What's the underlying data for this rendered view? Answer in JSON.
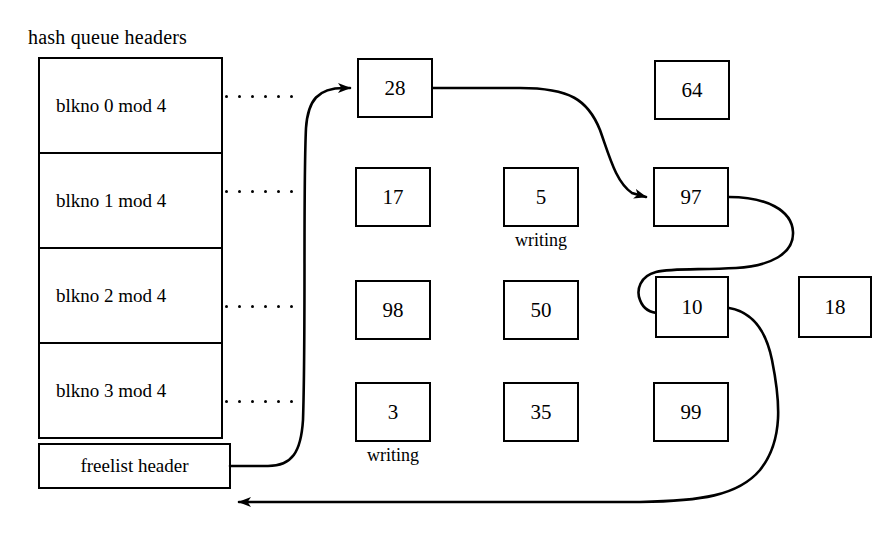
{
  "diagram": {
    "title": "hash queue headers",
    "freelist_label": "freelist header",
    "hash_rows": [
      {
        "label": "blkno 0 mod 4"
      },
      {
        "label": "blkno 1 mod 4"
      },
      {
        "label": "blkno 2 mod 4"
      },
      {
        "label": "blkno 3 mod 4"
      }
    ],
    "buffers": [
      {
        "id": "buf-28",
        "value": "28",
        "note": "",
        "x": 357,
        "y": 58,
        "w": 76,
        "h": 60
      },
      {
        "id": "buf-64",
        "value": "64",
        "note": "",
        "x": 654,
        "y": 60,
        "w": 76,
        "h": 60
      },
      {
        "id": "buf-17",
        "value": "17",
        "note": "",
        "x": 355,
        "y": 167,
        "w": 76,
        "h": 60
      },
      {
        "id": "buf-5",
        "value": "5",
        "note": "writing",
        "x": 503,
        "y": 167,
        "w": 76,
        "h": 60
      },
      {
        "id": "buf-97",
        "value": "97",
        "note": "",
        "x": 653,
        "y": 167,
        "w": 76,
        "h": 60
      },
      {
        "id": "buf-98",
        "value": "98",
        "note": "",
        "x": 355,
        "y": 280,
        "w": 76,
        "h": 60
      },
      {
        "id": "buf-50",
        "value": "50",
        "note": "",
        "x": 503,
        "y": 280,
        "w": 76,
        "h": 60
      },
      {
        "id": "buf-10",
        "value": "10",
        "note": "",
        "x": 655,
        "y": 276,
        "w": 74,
        "h": 62
      },
      {
        "id": "buf-18",
        "value": "18",
        "note": "",
        "x": 798,
        "y": 276,
        "w": 74,
        "h": 62
      },
      {
        "id": "buf-3",
        "value": "3",
        "note": "writing",
        "x": 355,
        "y": 382,
        "w": 76,
        "h": 60
      },
      {
        "id": "buf-35",
        "value": "35",
        "note": "",
        "x": 503,
        "y": 382,
        "w": 76,
        "h": 60
      },
      {
        "id": "buf-99",
        "value": "99",
        "note": "",
        "x": 653,
        "y": 382,
        "w": 76,
        "h": 60
      }
    ],
    "colors": {
      "stroke": "#000000",
      "background": "#ffffff"
    }
  }
}
